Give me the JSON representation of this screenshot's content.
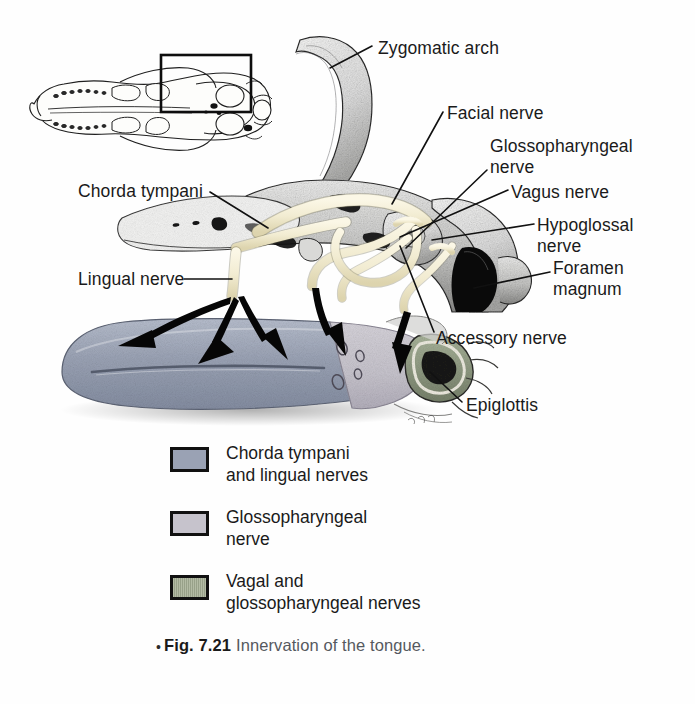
{
  "figure": {
    "caption_bullet": "•",
    "caption_number": "Fig. 7.21",
    "caption_text": "Innervation of the tongue.",
    "inset_name": "ventral-skull-overview-with-locator-box"
  },
  "callouts": {
    "zygomatic_arch": "Zygomatic arch",
    "facial_nerve": "Facial nerve",
    "glossopharyngeal_nerve": "Glossopharyngeal\nnerve",
    "vagus_nerve": "Vagus nerve",
    "hypoglossal_nerve": "Hypoglossal\nnerve",
    "foramen_magnum": "Foramen\nmagnum",
    "accessory_nerve": "Accessory nerve",
    "epiglottis": "Epiglottis",
    "chorda_tympani": "Chorda tympani",
    "lingual_nerve": "Lingual nerve"
  },
  "legend": {
    "items": [
      {
        "label": "Chorda tympani\nand lingual nerves",
        "color": "#9aa2b4",
        "pattern": "solid",
        "swatch_name": "legend-swatch-chorda-lingual"
      },
      {
        "label": "Glossopharyngeal\nnerve",
        "color": "#c6c3cc",
        "pattern": "solid",
        "swatch_name": "legend-swatch-glossopharyngeal"
      },
      {
        "label": "Vagal and\nglossopharyngeal nerves",
        "color": "#b3bba4",
        "pattern": "vertical-hatch",
        "swatch_name": "legend-swatch-vagal-glossopharyngeal"
      }
    ]
  },
  "colors": {
    "page_background": "#fefefe",
    "tongue_anterior": "#9aa2b4",
    "tongue_posterior": "#c6c3cc",
    "epiglottis": "#8f9a80",
    "nerve": "#f2ecd2",
    "bone_light": "#efefee",
    "bone_mid": "#c9c9c7",
    "bone_dark": "#6e6e6c",
    "ink": "#1a1a1a",
    "caption_text": "#56595e"
  },
  "anatomy": {
    "arrow_count": 5,
    "arrow_targets": [
      "tongue-tip-left",
      "tongue-body-mid-left",
      "tongue-body-mid-right",
      "tongue-posterior-papillae",
      "epiglottis-region"
    ],
    "structures": [
      "zygomatic-arch",
      "cranial-base",
      "foramen-magnum",
      "tympanic-bulla",
      "tongue",
      "epiglottis",
      "facial-nerve",
      "glossopharyngeal-nerve",
      "vagus-nerve",
      "hypoglossal-nerve",
      "accessory-nerve",
      "chorda-tympani",
      "lingual-nerve"
    ]
  }
}
